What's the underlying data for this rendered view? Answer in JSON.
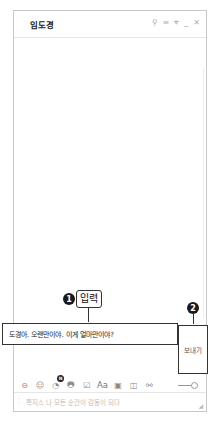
{
  "window": {
    "title": "임도경",
    "titlebar_icons": [
      {
        "name": "search-icon",
        "glyph": "⚲"
      },
      {
        "name": "menu-icon",
        "glyph": "≡"
      },
      {
        "name": "pin-icon",
        "glyph": "⌖"
      },
      {
        "name": "minimize-icon",
        "glyph": "_"
      },
      {
        "name": "close-icon",
        "glyph": "✕"
      }
    ]
  },
  "input": {
    "value": "도경아. 오랜만이야. 이게 얼마만이야?"
  },
  "send_button": {
    "label": "보내기"
  },
  "callouts": [
    {
      "number": "1",
      "label": "입력"
    },
    {
      "number": "2",
      "label": ""
    }
  ],
  "toolbar": {
    "icons": [
      {
        "name": "emoticon-icon",
        "glyph": "⊖"
      },
      {
        "name": "smile-icon",
        "glyph": "☺"
      },
      {
        "name": "sticker-icon",
        "glyph": "◔",
        "badge": "N"
      },
      {
        "name": "file-icon",
        "glyph": "🖶"
      },
      {
        "name": "checklist-icon",
        "glyph": "☑"
      },
      {
        "name": "font-icon",
        "glyph": "Aa"
      },
      {
        "name": "screen-capture-icon",
        "glyph": "▣"
      },
      {
        "name": "calendar-icon",
        "glyph": "◫"
      },
      {
        "name": "link-icon",
        "glyph": "⚯"
      }
    ]
  },
  "footer": {
    "text": "쪽지스 나 모든 순간이 감동이 되다"
  },
  "colors": {
    "border": "#c8c8c8",
    "callout": "#1a1a1a",
    "muted": "#b0b0b0"
  }
}
